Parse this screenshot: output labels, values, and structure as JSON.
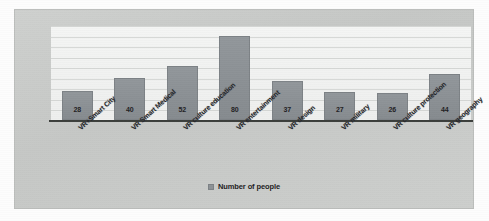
{
  "chart_data": {
    "type": "bar",
    "title": "",
    "subtitle": "",
    "xlabel": "",
    "ylabel": "",
    "ylim": [
      0,
      90
    ],
    "grid": true,
    "gridline_count": 9,
    "legend_position": "bottom",
    "legend": [
      "Number of people"
    ],
    "bar_color": "#8d9296",
    "axis_color": "#3c3f3c",
    "plot_background": "#f2f3f2",
    "frame_background": "#c9cbc9",
    "categories": [
      "VR+Smart City",
      "VR Smart Medical",
      "VR culture education",
      "VR entertainment",
      "VR design",
      "VR military",
      "VR culture protection",
      "VR geography"
    ],
    "series": [
      {
        "name": "Number of people",
        "values": [
          28,
          40,
          52,
          80,
          37,
          27,
          26,
          44
        ]
      }
    ],
    "value_labels": [
      "28",
      "40",
      "52",
      "80",
      "37",
      "27",
      "26",
      "44"
    ]
  },
  "legend": {
    "swatch_color": "#8d9296",
    "label": "Number of people"
  }
}
